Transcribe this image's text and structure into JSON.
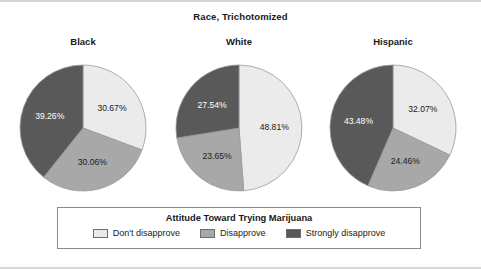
{
  "chart_data": {
    "type": "pie",
    "title": "Race, Trichotomized",
    "legend_title": "Attitude Toward Trying Marijuana",
    "legend_position": "bottom",
    "categories": [
      "Don't disapprove",
      "Disapprove",
      "Strongly disapprove"
    ],
    "colors": [
      "#ebebeb",
      "#a8a8a8",
      "#595959"
    ],
    "panels": [
      {
        "label": "Black",
        "values": [
          30.67,
          30.06,
          39.26
        ],
        "value_labels": [
          "30.67%",
          "30.06%",
          "39.26%"
        ]
      },
      {
        "label": "White",
        "values": [
          48.81,
          23.65,
          27.54
        ],
        "value_labels": [
          "48.81%",
          "23.65%",
          "27.54%"
        ]
      },
      {
        "label": "Hispanic",
        "values": [
          32.07,
          24.46,
          43.48
        ],
        "value_labels": [
          "32.07%",
          "24.46%",
          "43.48%"
        ]
      }
    ]
  },
  "figure": {
    "border_color": "#d6d6d6",
    "legend_border_color": "#8a8a8a",
    "text_color": "#1a1a1a"
  }
}
